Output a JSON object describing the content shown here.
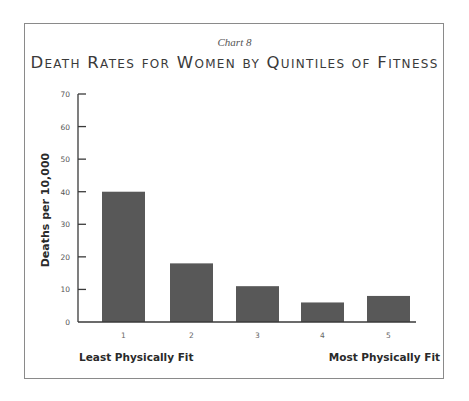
{
  "chart_data": {
    "type": "bar",
    "label": "Chart 8",
    "title": "Death Rates for Women by Quintiles of Fitness",
    "xlabel": "",
    "ylabel": "Deaths per 10,000",
    "categories": [
      "1",
      "2",
      "3",
      "4",
      "5"
    ],
    "values": [
      40,
      18,
      11,
      6,
      8
    ],
    "ylim": [
      0,
      70
    ],
    "yticks": [
      0,
      10,
      20,
      30,
      40,
      50,
      60,
      70
    ],
    "grid": false,
    "legend": null,
    "annotations": {
      "left": "Least Physically Fit",
      "right": "Most Physically Fit"
    },
    "bar_color": "#585858"
  }
}
